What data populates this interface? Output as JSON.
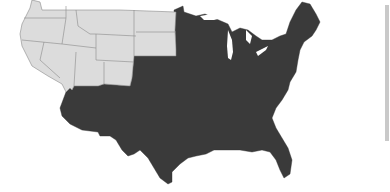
{
  "map": {
    "title": "",
    "region": "Contiguous United States",
    "colors": {
      "highlighted": "#3a3a3a",
      "non_highlighted": "#dcdcdc",
      "state_border": "#8a8a8a",
      "background": "#ffffff"
    },
    "legend": [],
    "light_states": [
      "WA",
      "OR",
      "CA",
      "NV",
      "ID",
      "MT",
      "WY",
      "UT",
      "CO",
      "ND",
      "SD"
    ],
    "dark_region": "All remaining states (NE, KS, OK, TX, AZ, NM and all states east)"
  },
  "side_bar": {
    "present": true
  }
}
